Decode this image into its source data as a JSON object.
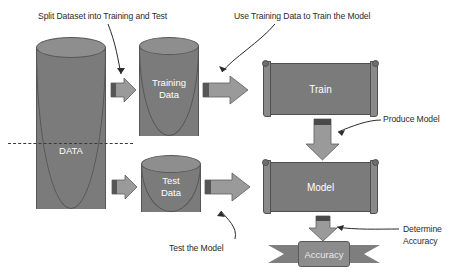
{
  "diagram": {
    "background": "#ffffff",
    "colors": {
      "shape_fill": "#7b7b7b",
      "shape_top": "#8e8e8e",
      "arrow_fill": "#9a9a9a",
      "arrow_tail": "#565656",
      "stroke": "#4f4f4f",
      "label_text": "#2b2b2b",
      "shape_text": "#ffffff"
    }
  },
  "annotations": {
    "split": "Split Dataset into Training and Test",
    "use_training": "Use Training Data to Train the Model",
    "produce_model": "Produce Model",
    "test_model": "Test the Model",
    "determine_accuracy_line1": "Determine",
    "determine_accuracy_line2": "Accuracy"
  },
  "nodes": {
    "data": {
      "label": "DATA",
      "shape": "cylinder"
    },
    "training_data": {
      "label_line1": "Training",
      "label_line2": "Data",
      "shape": "cylinder"
    },
    "test_data": {
      "label_line1": "Test",
      "label_line2": "Data",
      "shape": "cylinder"
    },
    "train": {
      "label": "Train",
      "shape": "scroll"
    },
    "model": {
      "label": "Model",
      "shape": "scroll"
    },
    "accuracy": {
      "label": "Accuracy",
      "shape": "ribbon"
    }
  },
  "connectors": [
    {
      "name": "data-to-training",
      "direction": "right"
    },
    {
      "name": "data-to-test",
      "direction": "right"
    },
    {
      "name": "training-to-train",
      "direction": "right"
    },
    {
      "name": "test-to-model",
      "direction": "right"
    },
    {
      "name": "train-to-model",
      "direction": "down"
    },
    {
      "name": "model-to-accuracy",
      "direction": "down"
    }
  ]
}
